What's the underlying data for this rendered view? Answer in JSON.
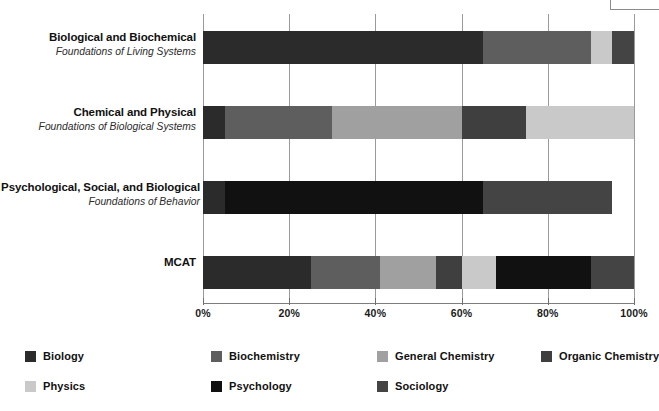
{
  "chart_data": {
    "type": "bar",
    "orientation": "horizontal",
    "stacked": true,
    "normalized": true,
    "title": "",
    "subtitle": "",
    "xlabel": "",
    "ylabel": "",
    "xlim": [
      0,
      100
    ],
    "xticks": [
      0,
      20,
      40,
      60,
      80,
      100
    ],
    "xticklabels": [
      "0%",
      "20%",
      "40%",
      "60%",
      "80%",
      "100%"
    ],
    "grid": "vertical",
    "legend_position": "bottom",
    "categories": [
      {
        "line1": "Biological and Biochemical",
        "line2": "Foundations of Living Systems"
      },
      {
        "line1": "Chemical and Physical",
        "line2": "Foundations of Biological Systems"
      },
      {
        "line1": "Psychological, Social, and Biological",
        "line2": "Foundations of Behavior"
      },
      {
        "line1": "MCAT",
        "line2": ""
      }
    ],
    "series": [
      {
        "name": "Biology",
        "color": "#2b2b2b",
        "values": [
          65,
          5,
          5,
          25
        ]
      },
      {
        "name": "Biochemistry",
        "color": "#5e5e5e",
        "values": [
          25,
          25,
          0,
          16
        ]
      },
      {
        "name": "General Chemistry",
        "color": "#a0a0a0",
        "values": [
          0,
          30,
          0,
          13
        ]
      },
      {
        "name": "Organic Chemistry",
        "color": "#3f3f3f",
        "values": [
          0,
          15,
          0,
          6
        ]
      },
      {
        "name": "Physics",
        "color": "#c9c9c9",
        "values": [
          5,
          25,
          0,
          8
        ]
      },
      {
        "name": "Psychology",
        "color": "#111111",
        "values": [
          0,
          0,
          60,
          22
        ]
      },
      {
        "name": "Sociology",
        "color": "#444444",
        "values": [
          5,
          0,
          30,
          10
        ]
      }
    ],
    "legend_entries": [
      {
        "label": "Biology",
        "color": "#2b2b2b"
      },
      {
        "label": "Biochemistry",
        "color": "#5e5e5e"
      },
      {
        "label": "General Chemistry",
        "color": "#a0a0a0"
      },
      {
        "label": "Organic Chemistry",
        "color": "#3f3f3f"
      },
      {
        "label": "Physics",
        "color": "#c9c9c9"
      },
      {
        "label": "Psychology",
        "color": "#111111"
      },
      {
        "label": "Sociology",
        "color": "#444444"
      }
    ]
  }
}
